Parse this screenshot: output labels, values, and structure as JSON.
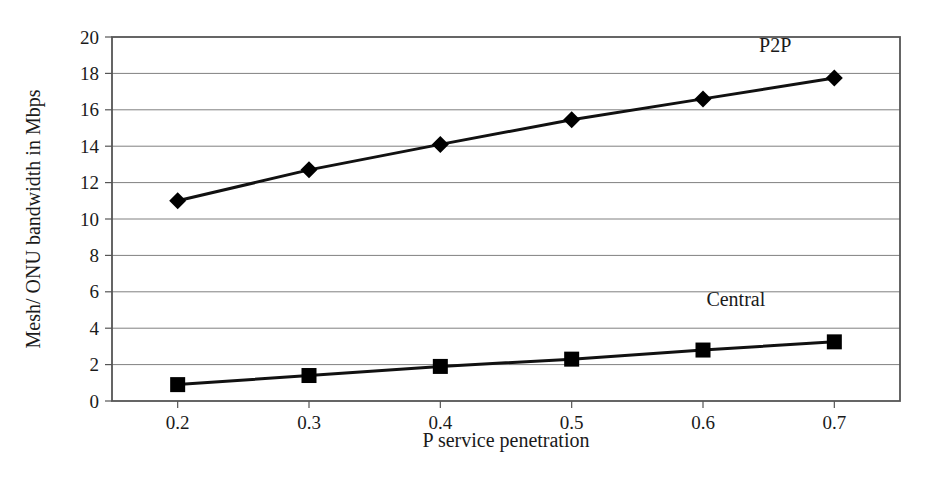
{
  "chart_data": {
    "type": "line",
    "title": "",
    "xlabel": "P service penetration",
    "ylabel": "Mesh/ ONU bandwidth in Mbps",
    "x": [
      0.2,
      0.3,
      0.4,
      0.5,
      0.6,
      0.7
    ],
    "xtick_labels": [
      "0.2",
      "0.3",
      "0.4",
      "0.5",
      "0.6",
      "0.7"
    ],
    "ytick_labels": [
      "0",
      "2",
      "4",
      "6",
      "8",
      "10",
      "12",
      "14",
      "16",
      "18",
      "20"
    ],
    "yticks": [
      0,
      2,
      4,
      6,
      8,
      10,
      12,
      14,
      16,
      18,
      20
    ],
    "ylim": [
      0,
      20
    ],
    "xlim": [
      0.15,
      0.75
    ],
    "grid": "horizontal",
    "legend_position": "inline-annotations",
    "series": [
      {
        "name": "P2P",
        "marker": "diamond",
        "color": "#000000",
        "label_x": 0.655,
        "label_y": 19.2,
        "values": [
          11.0,
          12.7,
          14.1,
          15.45,
          16.6,
          17.75
        ]
      },
      {
        "name": "Central",
        "marker": "square",
        "color": "#000000",
        "label_x": 0.625,
        "label_y": 5.2,
        "values": [
          0.9,
          1.4,
          1.9,
          2.3,
          2.8,
          3.25
        ]
      }
    ],
    "colors": {
      "axis": "#555555",
      "grid": "#808080",
      "data_line": "#111111",
      "text": "#1a1a1a",
      "background": "#ffffff"
    }
  }
}
